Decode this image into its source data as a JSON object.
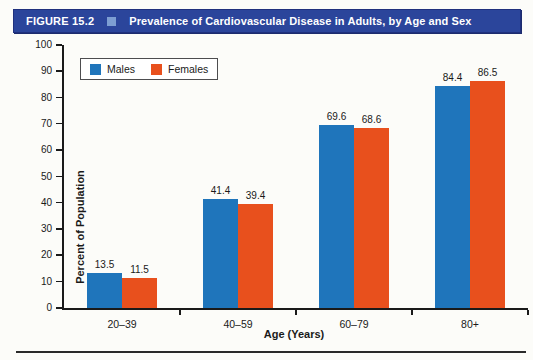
{
  "header": {
    "figure_label": "FIGURE 15.2",
    "title": "Prevalence of Cardiovascular Disease in Adults, by Age and Sex"
  },
  "colors": {
    "header_bg": "#2b459b",
    "header_marker": "#7d9ed2",
    "axis": "#1a1a1a",
    "male_blue": "#1f75bb",
    "female_orange": "#e8501d"
  },
  "chart_data": {
    "type": "bar",
    "title": "Prevalence of Cardiovascular Disease in Adults, by Age and Sex",
    "categories": [
      "20–39",
      "40–59",
      "60–79",
      "80+"
    ],
    "series": [
      {
        "name": "Males",
        "color": "#1f75bb",
        "values": [
          13.5,
          41.4,
          69.6,
          84.4
        ]
      },
      {
        "name": "Females",
        "color": "#e8501d",
        "values": [
          11.5,
          39.4,
          68.6,
          86.5
        ]
      }
    ],
    "xlabel": "Age (Years)",
    "ylabel": "Percent of Population",
    "ylim": [
      0,
      100
    ],
    "ytick_step": 10,
    "grid": false,
    "legend_position": "upper-left"
  }
}
